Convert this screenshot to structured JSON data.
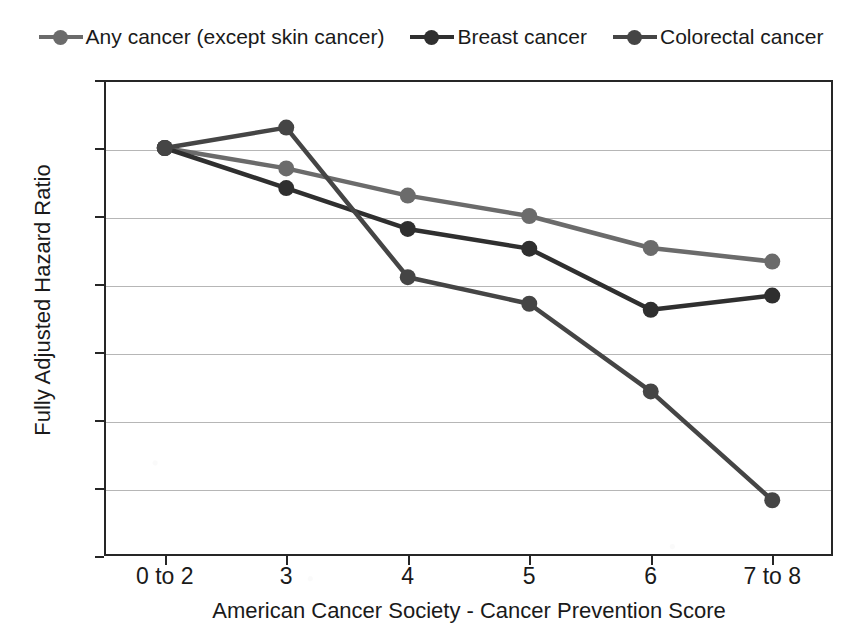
{
  "chart_data": {
    "type": "line",
    "title": "",
    "xlabel": "American Cancer Society - Cancer Prevention Score",
    "ylabel": "Fully Adjusted Hazard Ratio",
    "categories": [
      "0 to 2",
      "3",
      "4",
      "5",
      "6",
      "7 to 8"
    ],
    "ylim": [
      0.4,
      1.1
    ],
    "ytick_labels": [
      "1.1",
      "1",
      "0.9",
      "0.8",
      "0.7",
      "0.6",
      "0.5",
      "0.4"
    ],
    "ytick_values": [
      1.1,
      1.0,
      0.9,
      0.8,
      0.7,
      0.6,
      0.5,
      0.4
    ],
    "grid": true,
    "legend_position": "top",
    "series": [
      {
        "name": "Any cancer (except skin cancer)",
        "color": "#6b6b6b",
        "values": [
          1.0,
          0.97,
          0.93,
          0.9,
          0.853,
          0.833
        ]
      },
      {
        "name": "Breast cancer",
        "color": "#2f2f2f",
        "values": [
          1.0,
          0.941,
          0.881,
          0.852,
          0.762,
          0.783
        ]
      },
      {
        "name": "Colorectal cancer",
        "color": "#454545",
        "values": [
          1.0,
          1.03,
          0.81,
          0.771,
          0.642,
          0.482
        ]
      }
    ]
  },
  "axis_frame_color": "#262626",
  "gridline_color": "#b6b6b6"
}
